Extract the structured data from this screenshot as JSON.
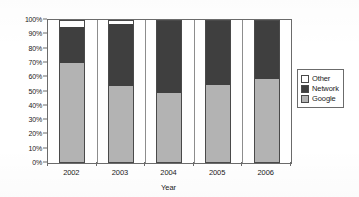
{
  "chart_data": {
    "type": "bar",
    "stacked": true,
    "title": "",
    "subtitle": "",
    "xlabel": "Year",
    "ylabel": "",
    "categories": [
      "2002",
      "2003",
      "2004",
      "2005",
      "2006"
    ],
    "series": [
      {
        "name": "Google",
        "color": "#b3b3b3",
        "values": [
          70,
          54,
          49,
          54.5,
          59
        ]
      },
      {
        "name": "Network",
        "color": "#3f3f3f",
        "values": [
          25,
          43,
          50.5,
          45,
          40.5
        ]
      },
      {
        "name": "Other",
        "color": "#ffffff",
        "values": [
          5,
          3,
          0.5,
          0.5,
          0.5
        ]
      }
    ],
    "ylim": [
      0,
      100
    ],
    "yticks": [
      0,
      10,
      20,
      30,
      40,
      50,
      60,
      70,
      80,
      90,
      100
    ],
    "ytick_labels": [
      "0%",
      "10%",
      "20%",
      "30%",
      "40%",
      "50%",
      "60%",
      "70%",
      "80%",
      "90%",
      "100%"
    ],
    "grid": false,
    "legend_position": "right",
    "legend_entries": [
      "Other",
      "Network",
      "Google"
    ],
    "units": "percent"
  },
  "axis": {
    "x_title": "Year",
    "x_tick_labels": [
      "2002",
      "2003",
      "2004",
      "2005",
      "2006"
    ],
    "y_tick_labels": [
      "100%",
      "90%",
      "80%",
      "70%",
      "60%",
      "50%",
      "40%",
      "30%",
      "20%",
      "10%",
      "0%"
    ]
  },
  "legend": {
    "items": [
      {
        "label": "Other",
        "color": "#ffffff"
      },
      {
        "label": "Network",
        "color": "#3f3f3f"
      },
      {
        "label": "Google",
        "color": "#b3b3b3"
      }
    ]
  },
  "colors": {
    "google": "#b3b3b3",
    "network": "#3f3f3f",
    "other": "#ffffff",
    "axis": "#6b6b6b",
    "text": "#1a1a1a",
    "background": "#ffffff"
  }
}
